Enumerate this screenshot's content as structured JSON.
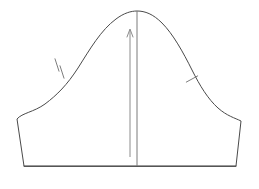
{
  "document": {
    "title": "Sleeve Cap Pattern Piece",
    "kind": "sewing-pattern-diagram",
    "background_color": "#ffffff",
    "canvas": {
      "width": 259,
      "height": 189
    }
  },
  "style": {
    "outline_color": "#4a4a4a",
    "outline_width": 1.0,
    "grainline_color": "#8c8c8c",
    "grainline_width": 1.0,
    "centerline_color": "#7a7a7a",
    "centerline_width": 1.0,
    "notch_color": "#6e6e6e",
    "notch_width": 0.9
  },
  "geometry": {
    "sleeve_cap_path": "M 24 166 L 17 119 C 22 113 34 112 45 104 C 57 95 67 85 78 68 C 90 49 101 30 116 19 C 124 13 131 11 137 11 C 145 11 153 14 162 23 C 173 34 183 52 192 70 C 200 86 208 99 218 108 C 227 116 235 118 241 121 L 236 166 Z",
    "baseline": {
      "x1": 24,
      "y1": 166,
      "x2": 236,
      "y2": 166
    },
    "left_underarm_edge": {
      "x1": 24,
      "y1": 166,
      "x2": 17,
      "y2": 119
    },
    "right_underarm_edge": {
      "x1": 241,
      "y1": 121,
      "x2": 236,
      "y2": 166
    },
    "center_line": {
      "x": 137,
      "y_top": 11,
      "y_bottom": 166
    },
    "grainline_arrow": {
      "x": 130,
      "y_top": 29,
      "y_bottom": 157,
      "arrowhead_half_width": 3,
      "arrowhead_length": 8
    },
    "front_notch": {
      "label": "single-notch",
      "count": 1,
      "position": {
        "x": 192,
        "y": 79
      },
      "angle_deg": -28,
      "length": 13
    },
    "back_notch": {
      "label": "double-notch",
      "count": 2,
      "positions": [
        {
          "x": 57,
          "y": 65
        },
        {
          "x": 62,
          "y": 72
        }
      ],
      "angle_deg": 22,
      "length": 13
    }
  },
  "labels": {
    "apex": "sleeve cap apex",
    "grainline": "grainline",
    "center_line": "center of sleeve",
    "hem": "sleeve hem / bicep line",
    "front_notch": "front armhole notch",
    "back_notch": "back armhole double notch"
  }
}
